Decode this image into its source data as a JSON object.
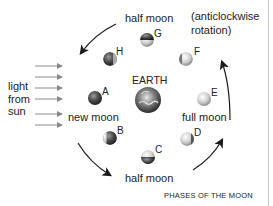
{
  "diagram": {
    "title": "PHASES OF THE MOON",
    "center": {
      "label": "EARTH"
    },
    "rotation_note": [
      "(anticlockwise",
      "rotation)"
    ],
    "light_source": {
      "label_lines": [
        "light",
        "from",
        "sun"
      ],
      "arrow_count": 6
    },
    "phase_labels": {
      "top": "half moon",
      "bottom": "half moon",
      "left": "new moon",
      "right": "full moon"
    },
    "moons": [
      {
        "letter": "A",
        "position": "left"
      },
      {
        "letter": "B",
        "position": "lower-left"
      },
      {
        "letter": "C",
        "position": "bottom"
      },
      {
        "letter": "D",
        "position": "lower-right"
      },
      {
        "letter": "E",
        "position": "right"
      },
      {
        "letter": "F",
        "position": "upper-right"
      },
      {
        "letter": "G",
        "position": "top"
      },
      {
        "letter": "H",
        "position": "upper-left"
      }
    ],
    "colors": {
      "arrow": "#1a1a1a",
      "light_arrow": "#8a8a8a",
      "moon_light": "#e0e0e0",
      "moon_dark": "#3a3a3a"
    }
  }
}
